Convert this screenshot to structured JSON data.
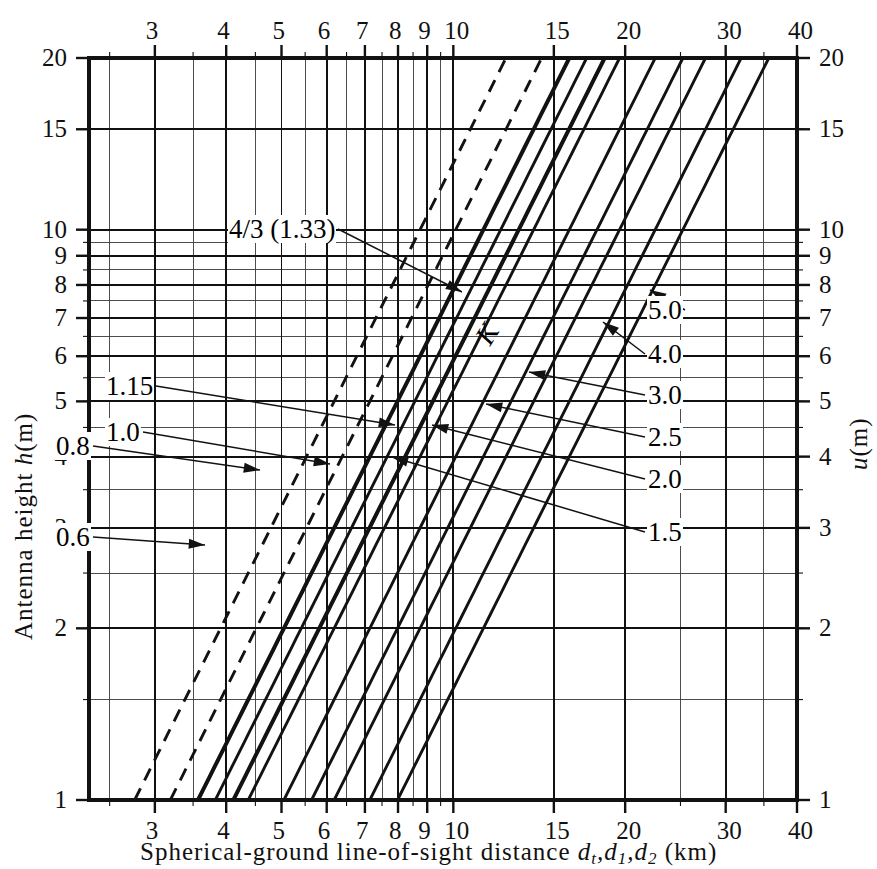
{
  "chart_data": {
    "type": "line",
    "title": "",
    "xlabel": "Spherical-ground line-of-sight distance d_t, d_1, d_2 (km)",
    "ylabel": "Antenna height h (m)",
    "y2label": "u (m)",
    "xscale": "log",
    "yscale": "log",
    "xlim": [
      2.3,
      40
    ],
    "ylim": [
      1,
      20
    ],
    "grid": true,
    "legend_position": "inline-labels",
    "x_ticks": [
      3,
      4,
      5,
      6,
      7,
      8,
      9,
      10,
      15,
      20,
      30,
      40
    ],
    "x_tick_labels": [
      "3",
      "4",
      "5",
      "6",
      "7",
      "8",
      "9",
      "10",
      "15",
      "20",
      "30",
      "40"
    ],
    "y_ticks": [
      1,
      2,
      3,
      4,
      5,
      6,
      7,
      8,
      9,
      10,
      15,
      20
    ],
    "y_tick_labels": [
      "1",
      "2",
      "3",
      "4",
      "5",
      "6",
      "7",
      "8",
      "9",
      "10",
      "15",
      "20"
    ],
    "y2_ticks": [
      1,
      2,
      3,
      4,
      5,
      6,
      7,
      8,
      9,
      10,
      15,
      20
    ],
    "y2_tick_labels": [
      "1",
      "2",
      "3",
      "4",
      "5",
      "6",
      "7",
      "8",
      "9",
      "10",
      "15",
      "20"
    ],
    "series_family_symbol": "K",
    "relation": "d = 3.57 * sqrt(K * h)",
    "series": [
      {
        "name": "0.6",
        "k": 0.6,
        "style": "dashed",
        "weight": "medium",
        "label": "0.6",
        "label_side": "left"
      },
      {
        "name": "0.8",
        "k": 0.8,
        "style": "dashed",
        "weight": "medium",
        "label": "0.8",
        "label_side": "left"
      },
      {
        "name": "1.0",
        "k": 1.0,
        "style": "solid",
        "weight": "bold",
        "label": "1.0",
        "label_side": "left"
      },
      {
        "name": "1.15",
        "k": 1.15,
        "style": "solid",
        "weight": "medium",
        "label": "1.15",
        "label_side": "left"
      },
      {
        "name": "4/3 (1.33)",
        "k": 1.33,
        "style": "solid",
        "weight": "bold",
        "label": "4/3 (1.33)",
        "label_side": "left"
      },
      {
        "name": "1.5",
        "k": 1.5,
        "style": "solid",
        "weight": "medium",
        "label": "1.5",
        "label_side": "right"
      },
      {
        "name": "2.0",
        "k": 2.0,
        "style": "solid",
        "weight": "medium",
        "label": "2.0",
        "label_side": "right"
      },
      {
        "name": "2.5",
        "k": 2.5,
        "style": "solid",
        "weight": "medium",
        "label": "2.5",
        "label_side": "right"
      },
      {
        "name": "3.0",
        "k": 3.0,
        "style": "solid",
        "weight": "medium",
        "label": "3.0",
        "label_side": "right"
      },
      {
        "name": "4.0",
        "k": 4.0,
        "style": "solid",
        "weight": "medium",
        "label": "4.0",
        "label_side": "right"
      },
      {
        "name": "5.0",
        "k": 5.0,
        "style": "solid",
        "weight": "medium",
        "label": "5.0",
        "label_side": "right"
      }
    ]
  },
  "axes": {
    "left_title": "Antenna height",
    "left_symbol": "h",
    "left_units": "(m)",
    "right_symbol": "u",
    "right_units": "(m)",
    "bottom_title": "Spherical-ground line-of-sight distance",
    "bottom_symbols": "dt,d1,d2",
    "bottom_units": "(km)"
  },
  "annotations": {
    "family_letter": "K"
  },
  "colors": {
    "ink": "#121212",
    "grid_minor": "#3a3a3a",
    "grid_major": "#111111",
    "paper": "#ffffff"
  }
}
